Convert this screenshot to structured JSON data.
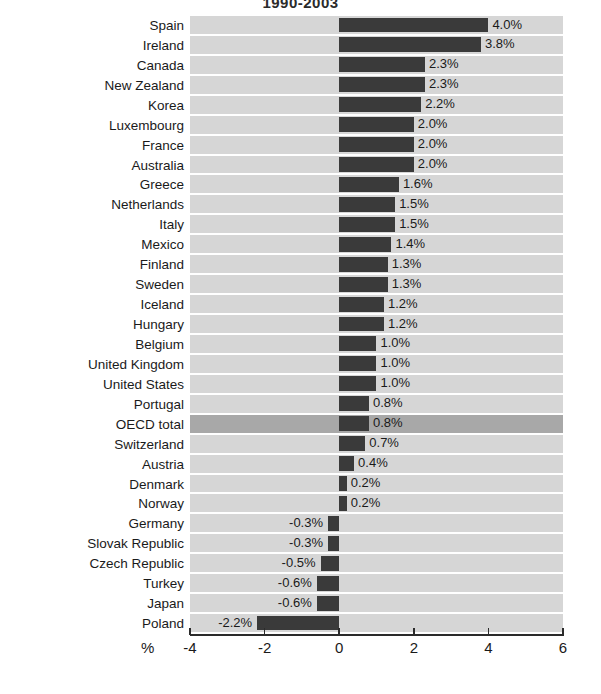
{
  "chart_data": {
    "type": "bar",
    "orientation": "horizontal",
    "title": "1990-2003",
    "xlabel": "%",
    "ylabel": "",
    "xlim": [
      -4,
      6
    ],
    "xticks": [
      "-4",
      "-2",
      "0",
      "2",
      "4",
      "6"
    ],
    "grid": true,
    "legend": "none",
    "highlight_category": "OECD total",
    "categories": [
      "Spain",
      "Ireland",
      "Canada",
      "New Zealand",
      "Korea",
      "Luxembourg",
      "France",
      "Australia",
      "Greece",
      "Netherlands",
      "Italy",
      "Mexico",
      "Finland",
      "Sweden",
      "Iceland",
      "Hungary",
      "Belgium",
      "United Kingdom",
      "United States",
      "Portugal",
      "OECD total",
      "Switzerland",
      "Austria",
      "Denmark",
      "Norway",
      "Germany",
      "Slovak Republic",
      "Czech Republic",
      "Turkey",
      "Japan",
      "Poland"
    ],
    "values": [
      4.0,
      3.8,
      2.3,
      2.3,
      2.2,
      2.0,
      2.0,
      2.0,
      1.6,
      1.5,
      1.5,
      1.4,
      1.3,
      1.3,
      1.2,
      1.2,
      1.0,
      1.0,
      1.0,
      0.8,
      0.8,
      0.7,
      0.4,
      0.2,
      0.2,
      -0.3,
      -0.3,
      -0.5,
      -0.6,
      -0.6,
      -2.2
    ],
    "value_labels": [
      "4.0%",
      "3.8%",
      "2.3%",
      "2.3%",
      "2.2%",
      "2.0%",
      "2.0%",
      "2.0%",
      "1.6%",
      "1.5%",
      "1.5%",
      "1.4%",
      "1.3%",
      "1.3%",
      "1.2%",
      "1.2%",
      "1.0%",
      "1.0%",
      "1.0%",
      "0.8%",
      "0.8%",
      "0.7%",
      "0.4%",
      "0.2%",
      "0.2%",
      "-0.3%",
      "-0.3%",
      "-0.5%",
      "-0.6%",
      "-0.6%",
      "-2.2%"
    ],
    "colors": {
      "bar": "#3a3a3a",
      "band": "#d6d6d6",
      "band_highlight": "#a8a8a8",
      "gridline": "#ffffff",
      "axis": "#2b2b2b",
      "text": "#1a1a1a",
      "background": "#ffffff"
    }
  }
}
